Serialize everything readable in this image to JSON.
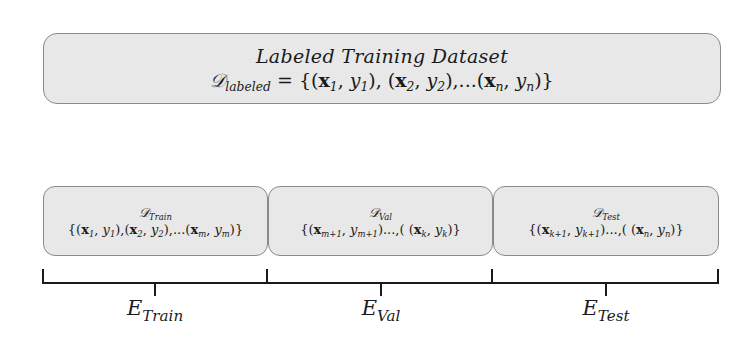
{
  "diagram": {
    "type": "dataset-split",
    "background_color": "#ffffff",
    "box_fill": "#e8e8e8",
    "box_border": "#8a8a8a",
    "line_color": "#1a1a1a"
  },
  "labeled_dataset": {
    "title": "Labeled Training Dataset",
    "symbol": "𝒟",
    "symbol_subscript": "labeled",
    "equals": " = {(",
    "pairs": [
      {
        "x": "x",
        "x_sub": "1",
        "y": "y",
        "y_sub": "1"
      },
      {
        "x": "x",
        "x_sub": "2",
        "y": "y",
        "y_sub": "2"
      },
      {
        "x": "x",
        "x_sub": "n",
        "y": "y",
        "y_sub": "n"
      }
    ],
    "formula_text": "D_labeled = {(x1, y1), (x2, y2),...(xn, yn)}"
  },
  "splits": [
    {
      "name_symbol": "𝒟",
      "name_subscript": "Train",
      "set_text": "{(x1, y1),(x2, y2),...(xm, ym)}",
      "pairs": [
        {
          "x_sub": "1",
          "y_sub": "1"
        },
        {
          "x_sub": "2",
          "y_sub": "2"
        },
        {
          "x_sub": "m",
          "y_sub": "m"
        }
      ],
      "evaluation_label": "E",
      "evaluation_subscript": "Train"
    },
    {
      "name_symbol": "𝒟",
      "name_subscript": "Val",
      "set_text": "{(xm+1, ym+1)...,( (xk, yk)}",
      "pairs": [
        {
          "x_sub": "m+1",
          "y_sub": "m+1"
        },
        {
          "x_sub": "k",
          "y_sub": "k"
        }
      ],
      "evaluation_label": "E",
      "evaluation_subscript": "Val"
    },
    {
      "name_symbol": "𝒟",
      "name_subscript": "Test",
      "set_text": "{(xk+1, yk+1)...,( (xn, yn)}",
      "pairs": [
        {
          "x_sub": "k+1",
          "y_sub": "k+1"
        },
        {
          "x_sub": "n",
          "y_sub": "n"
        }
      ],
      "evaluation_label": "E",
      "evaluation_subscript": "Test"
    }
  ],
  "text": {
    "x": "x",
    "y": "y",
    "open_pair": "(",
    "close_pair": ")",
    "comma": ", ",
    "tight_comma": ",",
    "ellipsis": "...",
    "ellipsis_comma": "...,( ",
    "open_set": "{(",
    "close_set": ")}",
    "equals_open": " = {",
    "sep_pair": "), ",
    "sep_pair_tight": "),",
    "sep_pair_ellipsis": "),...("
  }
}
